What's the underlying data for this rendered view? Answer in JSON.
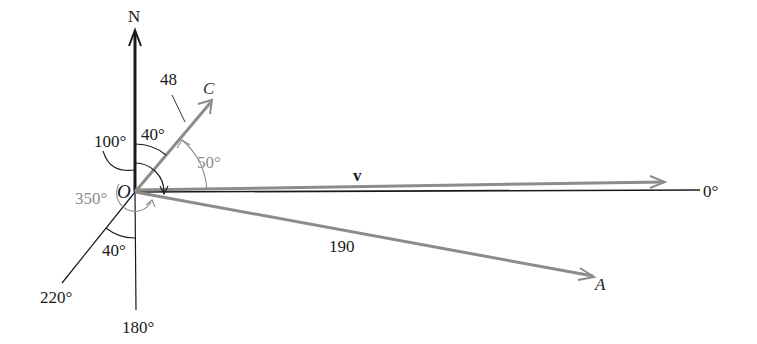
{
  "diagram": {
    "type": "vector bearing diagram",
    "origin_label": "O",
    "north_label": "N",
    "axis_labels": {
      "east": "0°",
      "south": "180°",
      "southwest": "220°"
    },
    "vectors": [
      {
        "name": "C",
        "label": "C",
        "magnitude_label": "48",
        "color": "#8c8c8c"
      },
      {
        "name": "v",
        "label": "v",
        "color": "#8c8c8c"
      },
      {
        "name": "A",
        "label": "A",
        "magnitude_label": "190",
        "color": "#8c8c8c"
      }
    ],
    "angles": {
      "north_to_c": "40°",
      "c_to_east": "50°",
      "bearing_100": "100°",
      "bearing_350": "350°",
      "southwest_to_south": "40°"
    },
    "colors": {
      "axis": "#1a1a1a",
      "vector": "#8c8c8c",
      "gray_label": "#8c8c8c"
    }
  }
}
